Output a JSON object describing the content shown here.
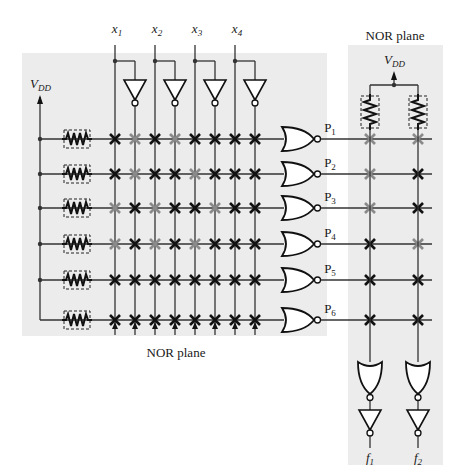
{
  "labels": {
    "left_plane_title": "NOR plane",
    "right_plane_title": "NOR plane",
    "vdd_left": "V",
    "vdd_left_sub": "DD",
    "vdd_right": "V",
    "vdd_right_sub": "DD"
  },
  "inputs": [
    {
      "name": "x",
      "sub": "1"
    },
    {
      "name": "x",
      "sub": "2"
    },
    {
      "name": "x",
      "sub": "3"
    },
    {
      "name": "x",
      "sub": "4"
    }
  ],
  "products": [
    {
      "name": "P",
      "sub": "1"
    },
    {
      "name": "P",
      "sub": "2"
    },
    {
      "name": "P",
      "sub": "3"
    },
    {
      "name": "P",
      "sub": "4"
    },
    {
      "name": "P",
      "sub": "5"
    },
    {
      "name": "P",
      "sub": "6"
    }
  ],
  "outputs": [
    {
      "name": "f",
      "sub": "1"
    },
    {
      "name": "f",
      "sub": "2"
    }
  ],
  "colors": {
    "plane_bg": "#ececec",
    "line": "#333333",
    "cross_active": "#111111",
    "cross_inactive": "#8a8a8a"
  },
  "left_plane_crosspoints": {
    "columns": [
      "x1",
      "x1'",
      "x2",
      "x2'",
      "x3",
      "x3'",
      "x4",
      "x4'"
    ],
    "rows": [
      [
        "B",
        "G",
        "B",
        "G",
        "B",
        "B",
        "B",
        "B"
      ],
      [
        "B",
        "G",
        "B",
        "B",
        "G",
        "B",
        "B",
        "B"
      ],
      [
        "G",
        "B",
        "G",
        "B",
        "B",
        "G",
        "B",
        "B"
      ],
      [
        "G",
        "B",
        "G",
        "B",
        "G",
        "B",
        "B",
        "B"
      ],
      [
        "B",
        "B",
        "B",
        "B",
        "B",
        "B",
        "B",
        "B"
      ],
      [
        "B",
        "B",
        "B",
        "B",
        "B",
        "B",
        "B",
        "B"
      ]
    ]
  },
  "right_plane_crosspoints": {
    "columns": [
      "f1",
      "f2"
    ],
    "rows": [
      [
        "G",
        "G"
      ],
      [
        "G",
        "B"
      ],
      [
        "G",
        "B"
      ],
      [
        "B",
        "G"
      ],
      [
        "B",
        "B"
      ],
      [
        "B",
        "B"
      ]
    ]
  }
}
